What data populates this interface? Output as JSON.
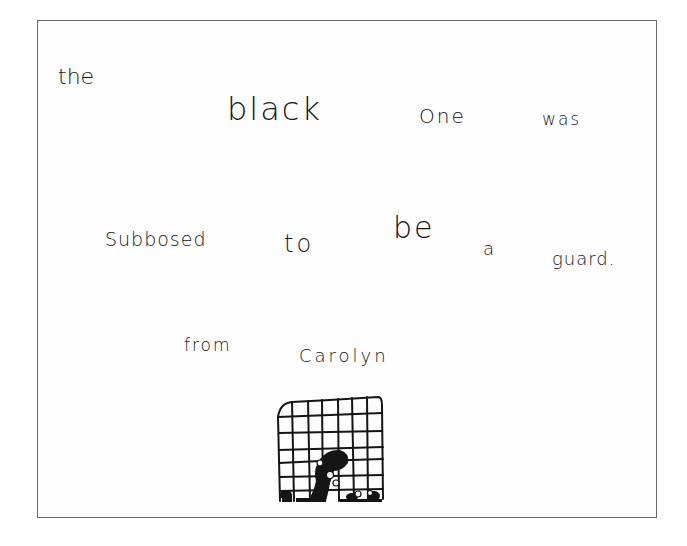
{
  "note": {
    "line1": [
      "the",
      "black",
      "One",
      "was"
    ],
    "line2": [
      "Subbosed",
      "to",
      "be",
      "a",
      "guard."
    ],
    "signature": [
      "from",
      "Carolyn"
    ]
  },
  "drawing": {
    "subject": "black figure behind cage grid",
    "icon": "caged-guard-drawing"
  },
  "colors": {
    "ink": "#151515",
    "border": "#6a6a6a",
    "paper": "#fdfdfd"
  }
}
